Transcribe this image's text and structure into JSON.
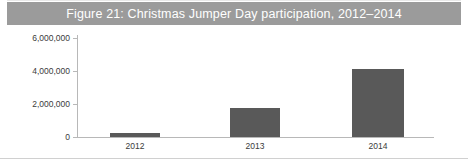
{
  "figure": {
    "title": "Figure 21: Christmas Jumper Day participation, 2012–2014",
    "title_band_color": "#9b9b9b",
    "title_text_color": "#ffffff",
    "background_color": "#ffffff"
  },
  "chart_data": {
    "type": "bar",
    "title": "Figure 21: Christmas Jumper Day participation, 2012–2014",
    "xlabel": "",
    "ylabel": "",
    "categories": [
      "2012",
      "2013",
      "2014"
    ],
    "values": [
      250000,
      1750000,
      4100000
    ],
    "series": [
      {
        "name": "Participation",
        "values": [
          250000,
          1750000,
          4100000
        ],
        "color": "#595959"
      }
    ],
    "ylim": [
      0,
      6000000
    ],
    "ytick_values": [
      0,
      2000000,
      4000000,
      6000000
    ],
    "ytick_labels": [
      "0",
      "2,000,000",
      "4,000,000",
      "6,000,000"
    ],
    "xtick_labels": [
      "2012",
      "2013",
      "2014"
    ],
    "grid": false,
    "legend": false,
    "legend_position": "none",
    "axis_color": "#b8b8b8",
    "tick_label_color": "#3b3b3b"
  }
}
